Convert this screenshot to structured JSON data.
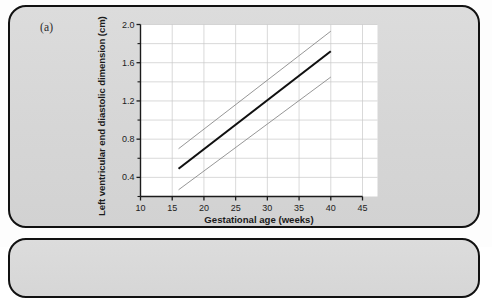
{
  "figure": {
    "panel_letter": "(a)",
    "background_color": "#d9d9d9",
    "border_color": "#111111",
    "plot_background": "#ffffff"
  },
  "chart_data": {
    "type": "line",
    "title": "",
    "xlabel": "Gestational age (weeks)",
    "ylabel": "Left ventricular end diastolic dimension (cm)",
    "xlim": [
      10,
      45
    ],
    "ylim": [
      0.2,
      2.0
    ],
    "xticks": [
      10,
      15,
      20,
      25,
      30,
      35,
      40,
      45
    ],
    "xticklabels": [
      "10",
      "15",
      "20",
      "25",
      "30",
      "35",
      "40",
      "45"
    ],
    "yticks": [
      0.4,
      0.8,
      1.2,
      1.6,
      2.0
    ],
    "yticklabels": [
      "0.4",
      "0.8",
      "1.2",
      "1.6",
      "2.0"
    ],
    "yminorticks": [
      0.2,
      0.6,
      1.0,
      1.4,
      1.8
    ],
    "grid": true,
    "grid_color": "#c9c9c9",
    "legend": null,
    "x": [
      16,
      40
    ],
    "series": [
      {
        "name": "upper-limit",
        "values": [
          0.7,
          1.93
        ],
        "style": "thin",
        "color": "#8a8a8a",
        "width": 0.9
      },
      {
        "name": "mean",
        "values": [
          0.49,
          1.72
        ],
        "style": "bold",
        "color": "#101010",
        "width": 2.1
      },
      {
        "name": "lower-limit",
        "values": [
          0.27,
          1.45
        ],
        "style": "thin",
        "color": "#8a8a8a",
        "width": 0.9
      }
    ]
  }
}
